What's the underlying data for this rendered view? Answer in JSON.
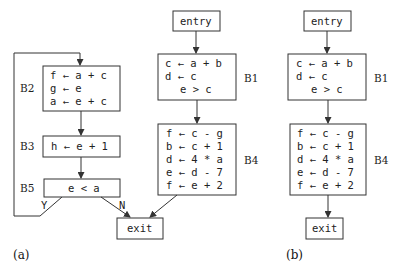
{
  "panel_a": {
    "label": "(a)",
    "blocks": {
      "B2": {
        "name": "B2",
        "lines": [
          "f ← a + c",
          "g ← e",
          "a ← e + c"
        ]
      },
      "B3": {
        "name": "B3",
        "lines": [
          "h ← e + 1"
        ]
      },
      "B5": {
        "name": "B5",
        "lines": [
          "e < a"
        ]
      },
      "entry": {
        "lines": [
          "entry"
        ]
      },
      "B1": {
        "name": "B1",
        "lines": [
          "c ← a + b",
          "d ← c",
          "e > c"
        ]
      },
      "B4": {
        "name": "B4",
        "lines": [
          "f ← c - g",
          "b ← c + 1",
          "d ← 4 * a",
          "e ← d - 7",
          "f ← e + 2"
        ]
      },
      "exit": {
        "lines": [
          "exit"
        ]
      }
    },
    "edge_labels": {
      "yes": "Y",
      "no": "N"
    }
  },
  "panel_b": {
    "label": "(b)",
    "blocks": {
      "entry": {
        "lines": [
          "entry"
        ]
      },
      "B1": {
        "name": "B1",
        "lines": [
          "c ← a + b",
          "d ← c",
          "e > c"
        ]
      },
      "B4": {
        "name": "B4",
        "lines": [
          "f ← c - g",
          "b ← c + 1",
          "d ← 4 * a",
          "e ← d - 7",
          "f ← e + 2"
        ]
      },
      "exit": {
        "lines": [
          "exit"
        ]
      }
    }
  },
  "edges": {
    "panel_a": [
      {
        "from": "B5",
        "to": "B2",
        "label": "Y"
      },
      {
        "from": "B2",
        "to": "B3"
      },
      {
        "from": "B3",
        "to": "B5"
      },
      {
        "from": "B5",
        "to": "exit",
        "label": "N"
      },
      {
        "from": "entry",
        "to": "B1"
      },
      {
        "from": "B1",
        "to": "B4"
      },
      {
        "from": "B4",
        "to": "exit"
      }
    ],
    "panel_b": [
      {
        "from": "entry",
        "to": "B1"
      },
      {
        "from": "B1",
        "to": "B4"
      },
      {
        "from": "B4",
        "to": "exit"
      }
    ]
  }
}
